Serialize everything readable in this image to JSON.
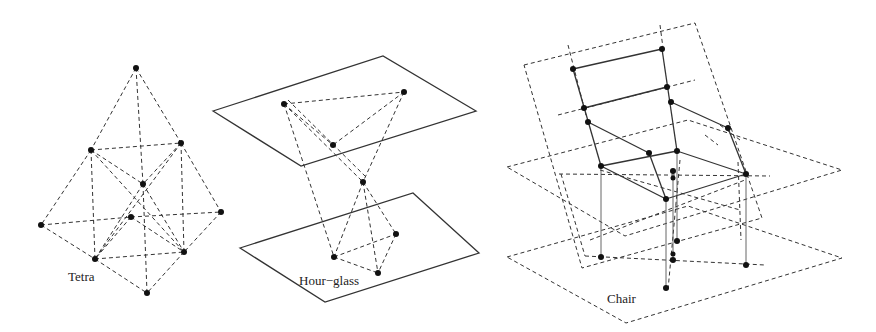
{
  "figures": [
    {
      "id": "tetra",
      "label": "Tetra"
    },
    {
      "id": "hourglass",
      "label": "Hour−glass"
    },
    {
      "id": "chair",
      "label": "Chair"
    }
  ]
}
